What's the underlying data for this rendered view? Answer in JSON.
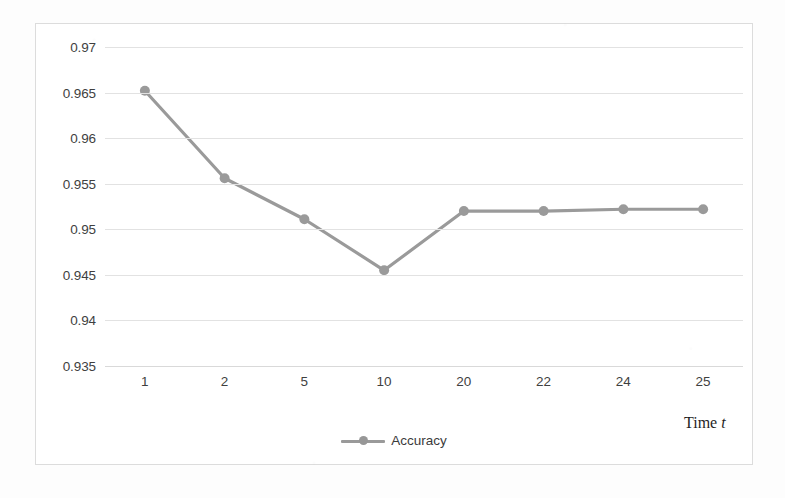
{
  "chart_data": {
    "type": "line",
    "title": "",
    "xlabel": "Time t",
    "ylabel": "",
    "categories": [
      "1",
      "2",
      "5",
      "10",
      "20",
      "22",
      "24",
      "25"
    ],
    "x": [
      1,
      2,
      5,
      10,
      20,
      22,
      24,
      25
    ],
    "series": [
      {
        "name": "Accuracy",
        "values": [
          0.9652,
          0.9556,
          0.9511,
          0.9455,
          0.952,
          0.952,
          0.9522,
          0.9522
        ],
        "color": "#9a9a9a",
        "marker": "circle"
      }
    ],
    "yticks": [
      "0.97",
      "0.965",
      "0.96",
      "0.955",
      "0.95",
      "0.945",
      "0.94",
      "0.935"
    ],
    "ytick_values": [
      0.97,
      0.965,
      0.96,
      0.955,
      0.95,
      0.945,
      0.94,
      0.935
    ],
    "ylim": [
      0.935,
      0.97
    ],
    "grid": "horizontal",
    "legend_position": "bottom-center",
    "legend_entries": [
      "Accuracy"
    ]
  },
  "axis": {
    "x_title_prefix": "Time ",
    "x_title_variable": "t"
  },
  "legend": {
    "accuracy_label": "Accuracy"
  },
  "colors": {
    "series_line": "#9a9a9a",
    "gridline": "#e2e2e2",
    "chart_border": "#dcdcdc",
    "tick_text": "#3f3f3f",
    "plot_background": "#ffffff"
  }
}
